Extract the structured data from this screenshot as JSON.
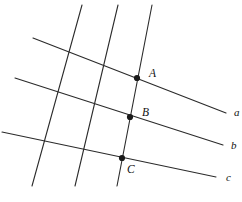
{
  "figure": {
    "width": 242,
    "height": 202,
    "background_color": "#ffffff",
    "stroke_color": "#2b2b2b",
    "label_color": "#111111"
  },
  "chart_data": {
    "type": "diagram",
    "xlabel": "",
    "ylabel": "",
    "xlim": [
      0,
      242
    ],
    "ylim": [
      0,
      202
    ],
    "grid": false,
    "legend": "none",
    "transversals": [
      {
        "name": "a",
        "label": "a",
        "label_x": 234,
        "label_y": 113,
        "x1": 33,
        "y1": 38,
        "x2": 226,
        "y2": 113
      },
      {
        "name": "b",
        "label": "b",
        "label_x": 231,
        "label_y": 146,
        "x1": 15,
        "y1": 78,
        "x2": 223,
        "y2": 145
      },
      {
        "name": "c",
        "label": "c",
        "label_x": 226,
        "label_y": 178,
        "x1": 2,
        "y1": 132,
        "x2": 216,
        "y2": 177
      }
    ],
    "steep_lines": [
      {
        "name": "steep-line-left",
        "x1": 82,
        "y1": 5,
        "x2": 32,
        "y2": 186
      },
      {
        "name": "steep-line-middle",
        "x1": 118,
        "y1": 5,
        "x2": 75,
        "y2": 186
      },
      {
        "name": "steep-line-right",
        "x1": 152,
        "y1": 5,
        "x2": 117,
        "y2": 186
      }
    ],
    "points": [
      {
        "name": "A",
        "label": "A",
        "x": 137,
        "y": 78,
        "label_x": 149,
        "label_y": 74,
        "on_lines": [
          "a",
          "steep-line-right"
        ]
      },
      {
        "name": "B",
        "label": "B",
        "x": 130,
        "y": 117,
        "label_x": 142,
        "label_y": 113,
        "on_lines": [
          "b",
          "steep-line-right"
        ]
      },
      {
        "name": "C",
        "label": "C",
        "x": 122,
        "y": 158,
        "label_x": 127,
        "label_y": 170,
        "on_lines": [
          "c",
          "steep-line-right"
        ]
      }
    ]
  }
}
